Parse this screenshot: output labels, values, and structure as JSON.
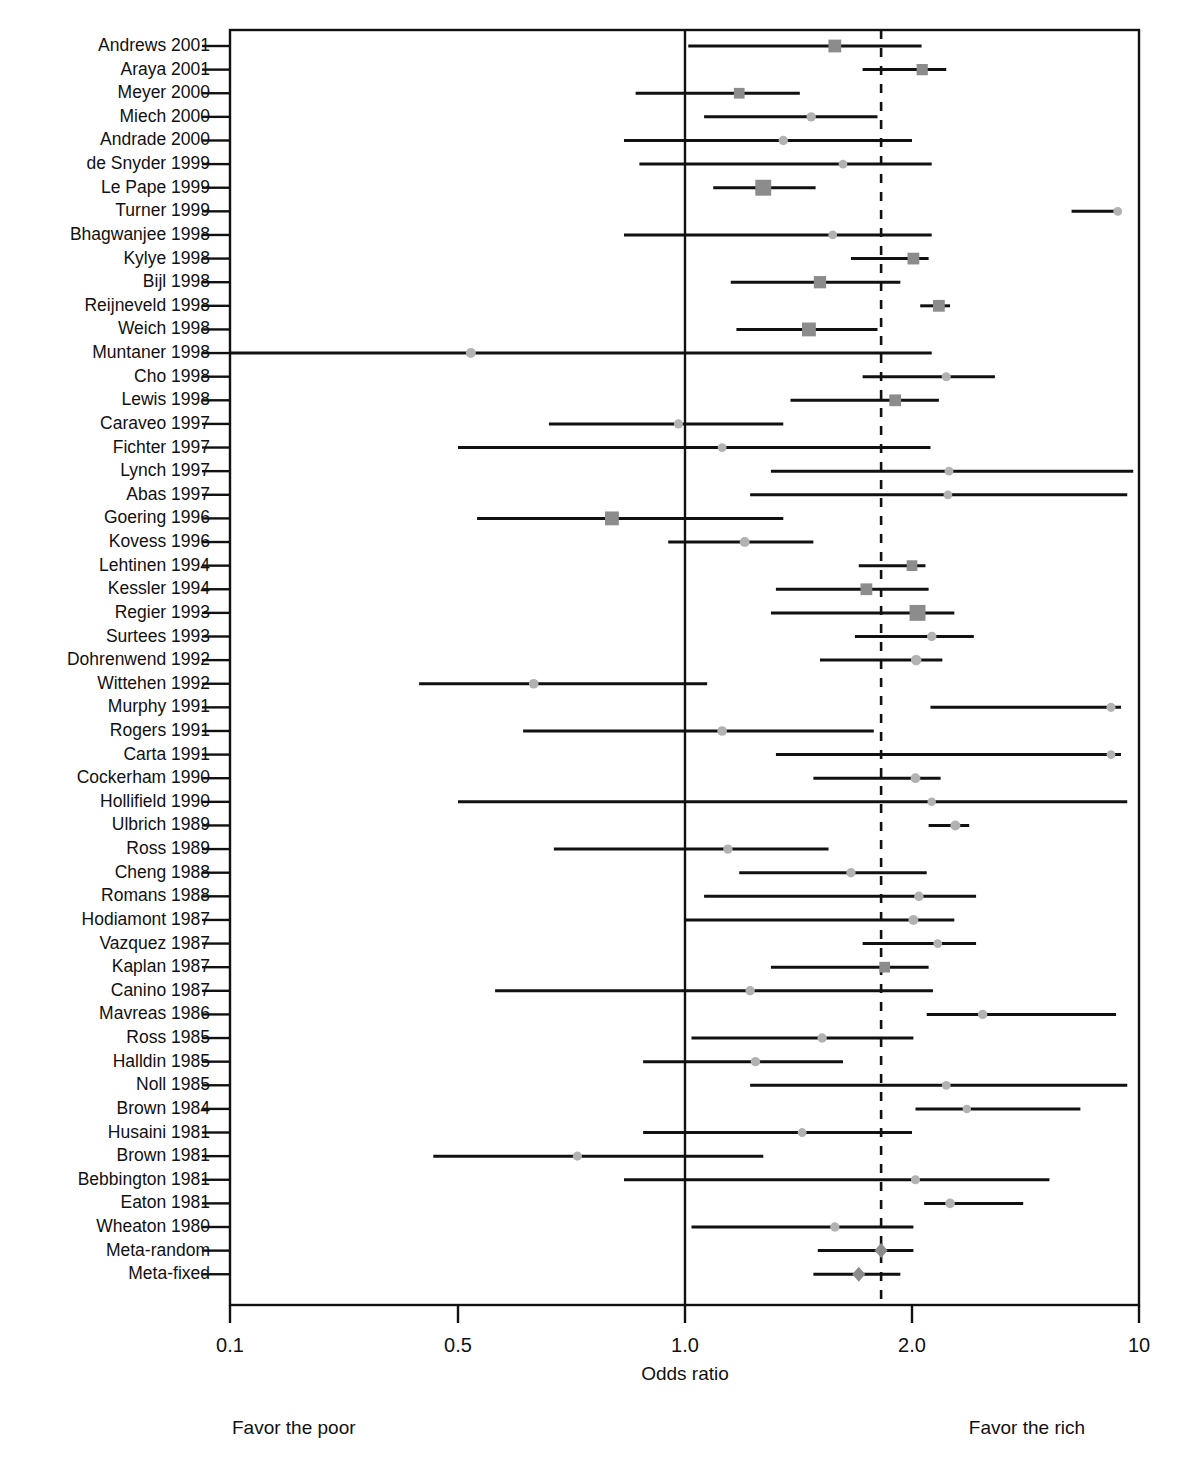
{
  "chart_data": {
    "type": "forest",
    "title": "",
    "xlabel": "Odds ratio",
    "ylabel": "",
    "x_scale": "segmented-log",
    "x_ticks": [
      "0.1",
      "0.5",
      "1.0",
      "2.0",
      "10"
    ],
    "x_tick_values": [
      0.1,
      0.5,
      1.0,
      2.0,
      10
    ],
    "xlim": [
      0.1,
      10
    ],
    "grid": false,
    "reference_line_value": 1.0,
    "pooled_reference_line_value": 1.82,
    "annotations": {
      "left": "Favor the poor",
      "right": "Favor the rich"
    },
    "marker_color": "#8c8c8c",
    "light_marker_color": "#b2b2b2",
    "line_color": "#111111",
    "categories": [
      "Andrews 2001",
      "Araya 2001",
      "Meyer 2000",
      "Miech 2000",
      "Andrade 2000",
      "de Snyder 1999",
      "Le Pape 1999",
      "Turner 1999",
      "Bhagwanjee 1998",
      "Kylye 1998",
      "Bijl 1998",
      "Reijneveld 1998",
      "Weich 1998",
      "Muntaner 1998",
      "Cho 1998",
      "Lewis 1998",
      "Caraveo 1997",
      "Fichter 1997",
      "Lynch 1997",
      "Abas 1997",
      "Goering 1996",
      "Kovess 1996",
      "Lehtinen 1994",
      "Kessler 1994",
      "Regier 1993",
      "Surtees 1993",
      "Dohrenwend 1992",
      "Wittehen 1992",
      "Murphy 1991",
      "Rogers 1991",
      "Carta 1991",
      "Cockerham 1990",
      "Hollifield 1990",
      "Ulbrich 1989",
      "Ross 1989",
      "Cheng 1988",
      "Romans 1988",
      "Hodiamont 1987",
      "Vazquez 1987",
      "Kaplan 1987",
      "Canino 1987",
      "Mavreas 1986",
      "Ross 1985",
      "Halldin 1985",
      "Noll 1985",
      "Brown 1984",
      "Husaini 1981",
      "Brown 1981",
      "Bebbington 1981",
      "Eaton 1981",
      "Wheaton 1980",
      "Meta-random",
      "Meta-fixed"
    ],
    "studies": [
      {
        "label": "Andrews 2001",
        "or": 1.58,
        "lo": 1.01,
        "hi": 2.14,
        "weight": 3.0,
        "marker": "square"
      },
      {
        "label": "Araya 2001",
        "or": 2.15,
        "lo": 1.72,
        "hi": 2.55,
        "weight": 2.4,
        "marker": "square"
      },
      {
        "label": "Meyer 2000",
        "or": 1.18,
        "lo": 0.86,
        "hi": 1.42,
        "weight": 2.2,
        "marker": "square"
      },
      {
        "label": "Miech 2000",
        "or": 1.47,
        "lo": 1.06,
        "hi": 1.8,
        "weight": 1.4,
        "marker": "circle"
      },
      {
        "label": "Andrade 2000",
        "or": 1.35,
        "lo": 0.83,
        "hi": 2.0,
        "weight": 1.4,
        "marker": "circle"
      },
      {
        "label": "de Snyder 1999",
        "or": 1.62,
        "lo": 0.87,
        "hi": 2.3,
        "weight": 1.2,
        "marker": "circle"
      },
      {
        "label": "Le Pape 1999",
        "or": 1.27,
        "lo": 1.09,
        "hi": 1.49,
        "weight": 4.2,
        "marker": "square"
      },
      {
        "label": "Turner 1999",
        "or": 8.6,
        "lo": 6.2,
        "hi": 8.6,
        "weight": 1.2,
        "marker": "circle"
      },
      {
        "label": "Bhagwanjee 1998",
        "or": 1.57,
        "lo": 0.83,
        "hi": 2.3,
        "weight": 1.2,
        "marker": "circle"
      },
      {
        "label": "Kylye 1998",
        "or": 2.02,
        "lo": 1.66,
        "hi": 2.25,
        "weight": 2.6,
        "marker": "square"
      },
      {
        "label": "Bijl 1998",
        "or": 1.51,
        "lo": 1.15,
        "hi": 1.93,
        "weight": 2.8,
        "marker": "square"
      },
      {
        "label": "Reijneveld 1998",
        "or": 2.42,
        "lo": 2.12,
        "hi": 2.62,
        "weight": 2.6,
        "marker": "square"
      },
      {
        "label": "Weich 1998",
        "or": 1.46,
        "lo": 1.17,
        "hi": 1.8,
        "weight": 3.4,
        "marker": "square"
      },
      {
        "label": "Muntaner 1998",
        "or": 0.52,
        "lo": 0.1,
        "hi": 2.3,
        "weight": 1.6,
        "marker": "circle"
      },
      {
        "label": "Cho 1998",
        "or": 2.55,
        "lo": 1.72,
        "hi": 3.6,
        "weight": 1.3,
        "marker": "circle"
      },
      {
        "label": "Lewis 1998",
        "or": 1.9,
        "lo": 1.38,
        "hi": 2.42,
        "weight": 2.6,
        "marker": "square"
      },
      {
        "label": "Caraveo 1997",
        "or": 0.98,
        "lo": 0.66,
        "hi": 1.35,
        "weight": 1.3,
        "marker": "circle"
      },
      {
        "label": "Fichter 1997",
        "or": 1.12,
        "lo": 0.5,
        "hi": 2.28,
        "weight": 1.2,
        "marker": "circle"
      },
      {
        "label": "Lynch 1997",
        "or": 2.6,
        "lo": 1.3,
        "hi": 9.6,
        "weight": 1.2,
        "marker": "circle"
      },
      {
        "label": "Abas 1997",
        "or": 2.58,
        "lo": 1.22,
        "hi": 9.2,
        "weight": 1.2,
        "marker": "circle"
      },
      {
        "label": "Goering 1996",
        "or": 0.8,
        "lo": 0.53,
        "hi": 1.35,
        "weight": 3.4,
        "marker": "square"
      },
      {
        "label": "Kovess 1996",
        "or": 1.2,
        "lo": 0.95,
        "hi": 1.48,
        "weight": 1.6,
        "marker": "circle"
      },
      {
        "label": "Lehtinen 1994",
        "or": 2.0,
        "lo": 1.7,
        "hi": 2.2,
        "weight": 2.2,
        "marker": "square"
      },
      {
        "label": "Kessler 1994",
        "or": 1.74,
        "lo": 1.32,
        "hi": 2.25,
        "weight": 2.6,
        "marker": "square"
      },
      {
        "label": "Regier 1993",
        "or": 2.08,
        "lo": 1.3,
        "hi": 2.7,
        "weight": 4.2,
        "marker": "square"
      },
      {
        "label": "Surtees 1993",
        "or": 2.3,
        "lo": 1.68,
        "hi": 3.1,
        "weight": 1.4,
        "marker": "circle"
      },
      {
        "label": "Dohrenwend 1992",
        "or": 2.06,
        "lo": 1.51,
        "hi": 2.48,
        "weight": 1.8,
        "marker": "circle"
      },
      {
        "label": "Wittehen 1992",
        "or": 0.63,
        "lo": 0.38,
        "hi": 1.07,
        "weight": 1.5,
        "marker": "circle"
      },
      {
        "label": "Murphy 1991",
        "or": 8.2,
        "lo": 2.28,
        "hi": 8.8,
        "weight": 1.3,
        "marker": "circle"
      },
      {
        "label": "Rogers 1991",
        "or": 1.12,
        "lo": 0.61,
        "hi": 1.78,
        "weight": 1.5,
        "marker": "circle"
      },
      {
        "label": "Carta 1991",
        "or": 8.2,
        "lo": 1.32,
        "hi": 8.8,
        "weight": 1.2,
        "marker": "circle"
      },
      {
        "label": "Cockerham 1990",
        "or": 2.05,
        "lo": 1.48,
        "hi": 2.45,
        "weight": 1.5,
        "marker": "circle"
      },
      {
        "label": "Hollifield 1990",
        "or": 2.3,
        "lo": 0.5,
        "hi": 9.2,
        "weight": 1.1,
        "marker": "circle"
      },
      {
        "label": "Ulbrich 1989",
        "or": 2.72,
        "lo": 2.25,
        "hi": 3.0,
        "weight": 1.6,
        "marker": "circle"
      },
      {
        "label": "Ross 1989",
        "or": 1.14,
        "lo": 0.67,
        "hi": 1.55,
        "weight": 1.4,
        "marker": "circle"
      },
      {
        "label": "Cheng 1988",
        "or": 1.66,
        "lo": 1.18,
        "hi": 2.22,
        "weight": 1.4,
        "marker": "circle"
      },
      {
        "label": "Romans 1988",
        "or": 2.1,
        "lo": 1.06,
        "hi": 3.15,
        "weight": 1.4,
        "marker": "circle"
      },
      {
        "label": "Hodiamont 1987",
        "or": 2.02,
        "lo": 1.0,
        "hi": 2.7,
        "weight": 1.6,
        "marker": "circle"
      },
      {
        "label": "Vazquez 1987",
        "or": 2.4,
        "lo": 1.72,
        "hi": 3.15,
        "weight": 1.2,
        "marker": "circle"
      },
      {
        "label": "Kaplan 1987",
        "or": 1.84,
        "lo": 1.3,
        "hi": 2.25,
        "weight": 2.2,
        "marker": "square"
      },
      {
        "label": "Canino 1987",
        "or": 1.22,
        "lo": 0.56,
        "hi": 2.32,
        "weight": 1.4,
        "marker": "circle"
      },
      {
        "label": "Mavreas 1986",
        "or": 3.3,
        "lo": 2.22,
        "hi": 8.5,
        "weight": 1.4,
        "marker": "circle"
      },
      {
        "label": "Ross 1985",
        "or": 1.52,
        "lo": 1.02,
        "hi": 2.02,
        "weight": 1.4,
        "marker": "circle"
      },
      {
        "label": "Halldin 1985",
        "or": 1.24,
        "lo": 0.88,
        "hi": 1.62,
        "weight": 1.4,
        "marker": "circle"
      },
      {
        "label": "Noll 1985",
        "or": 2.55,
        "lo": 1.22,
        "hi": 9.2,
        "weight": 1.2,
        "marker": "circle"
      },
      {
        "label": "Brown 1984",
        "or": 2.95,
        "lo": 2.05,
        "hi": 6.6,
        "weight": 1.1,
        "marker": "circle"
      },
      {
        "label": "Husaini 1981",
        "or": 1.43,
        "lo": 0.88,
        "hi": 2.0,
        "weight": 1.2,
        "marker": "circle"
      },
      {
        "label": "Brown 1981",
        "or": 0.72,
        "lo": 0.42,
        "hi": 1.27,
        "weight": 1.3,
        "marker": "circle"
      },
      {
        "label": "Bebbington 1981",
        "or": 2.05,
        "lo": 0.83,
        "hi": 5.3,
        "weight": 1.3,
        "marker": "circle"
      },
      {
        "label": "Eaton 1981",
        "or": 2.62,
        "lo": 2.18,
        "hi": 4.4,
        "weight": 1.5,
        "marker": "circle"
      },
      {
        "label": "Wheaton 1980",
        "or": 1.58,
        "lo": 1.02,
        "hi": 2.02,
        "weight": 1.4,
        "marker": "circle"
      }
    ],
    "summaries": [
      {
        "label": "Meta-random",
        "or": 1.82,
        "lo": 1.5,
        "hi": 2.02,
        "marker": "diamond"
      },
      {
        "label": "Meta-fixed",
        "or": 1.7,
        "lo": 1.48,
        "hi": 1.93,
        "marker": "diamond"
      }
    ]
  }
}
